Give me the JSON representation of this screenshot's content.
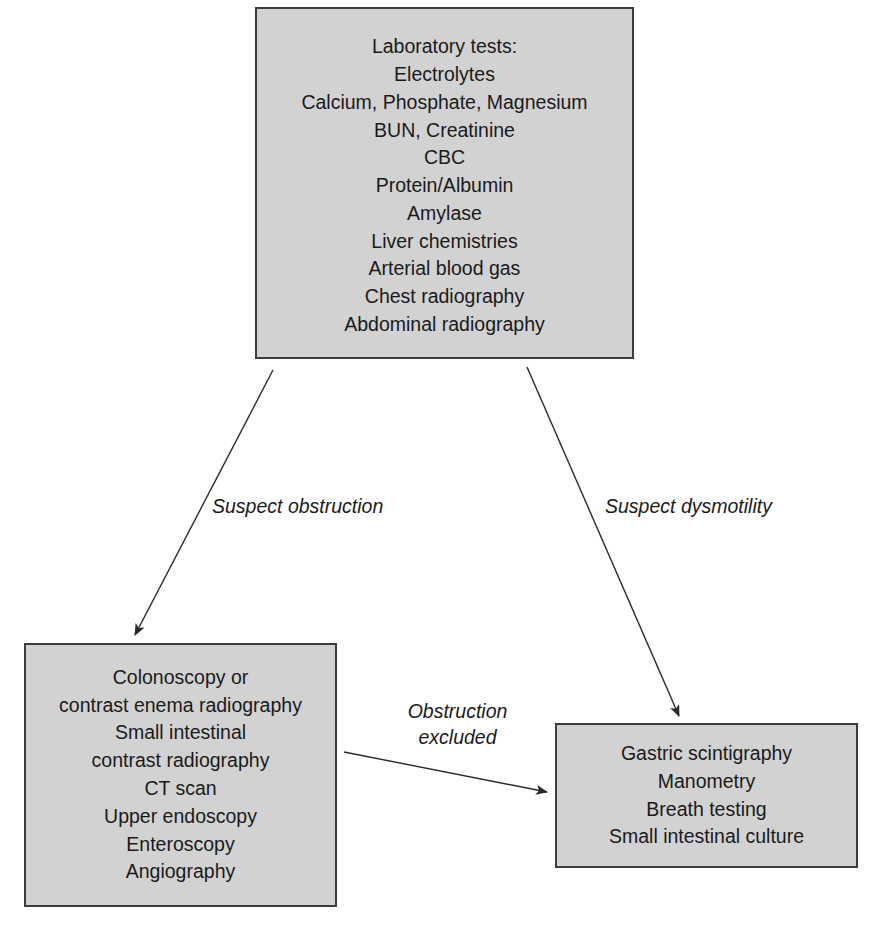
{
  "diagram": {
    "type": "flowchart",
    "colors": {
      "box_fill": "#d2d2d2",
      "box_border": "#3c3c3c",
      "line": "#2a2a2a",
      "background": "#ffffff"
    },
    "nodes": {
      "top": {
        "lines": [
          "Laboratory tests:",
          "Electrolytes",
          "Calcium, Phosphate, Magnesium",
          "BUN, Creatinine",
          "CBC",
          "Protein/Albumin",
          "Amylase",
          "Liver chemistries",
          "Arterial blood gas",
          "Chest radiography",
          "Abdominal radiography"
        ]
      },
      "left": {
        "lines": [
          "Colonoscopy or",
          "contrast enema radiography",
          "Small intestinal",
          "contrast radiography",
          "CT scan",
          "Upper endoscopy",
          "Enteroscopy",
          "Angiography"
        ]
      },
      "right": {
        "lines": [
          "Gastric scintigraphy",
          "Manometry",
          "Breath testing",
          "Small intestinal culture"
        ]
      }
    },
    "edges": [
      {
        "from": "top",
        "to": "left",
        "label": "Suspect obstruction"
      },
      {
        "from": "top",
        "to": "right",
        "label": "Suspect dysmotility"
      },
      {
        "from": "left",
        "to": "right",
        "label_lines": [
          "Obstruction",
          "excluded"
        ]
      }
    ]
  }
}
